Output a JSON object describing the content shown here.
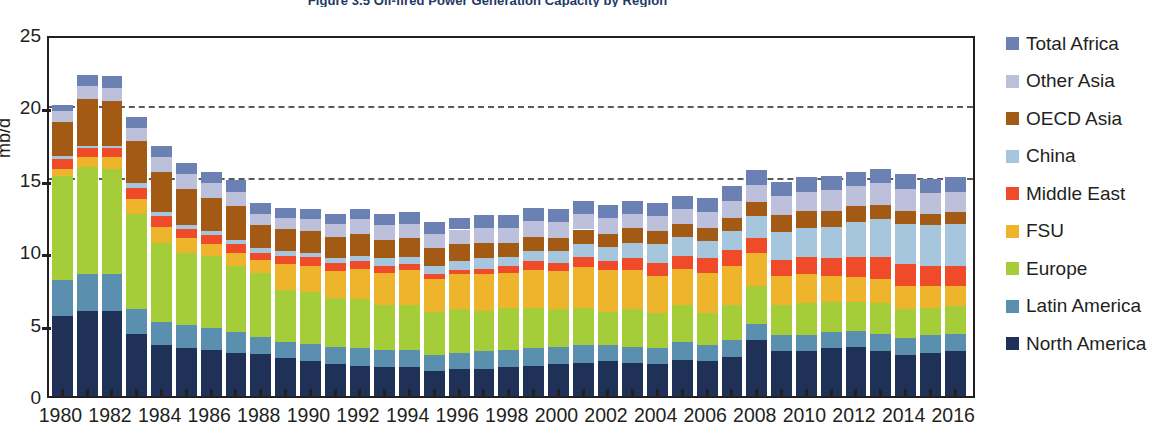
{
  "chart_data": {
    "type": "bar",
    "subtype": "stacked-bar",
    "title": "Figure 3.5  Oil-fired Power Generation Capacity by Region",
    "xlabel": "",
    "ylabel": "mb/d",
    "ylim": [
      0,
      25
    ],
    "yticks": [
      0,
      5,
      10,
      15,
      20,
      25
    ],
    "grid": false,
    "legend_position": "right",
    "reference_lines": [
      20.3,
      15.3
    ],
    "x": [
      1980,
      1981,
      1982,
      1983,
      1984,
      1985,
      1986,
      1987,
      1988,
      1989,
      1990,
      1991,
      1992,
      1993,
      1994,
      1995,
      1996,
      1997,
      1998,
      1999,
      2000,
      2001,
      2002,
      2003,
      2004,
      2005,
      2006,
      2007,
      2008,
      2009,
      2010,
      2011,
      2012,
      2013,
      2014,
      2015,
      2016
    ],
    "xtick_labels": [
      "1980",
      "1982",
      "1984",
      "1986",
      "1988",
      "1990",
      "1992",
      "1994",
      "1996",
      "1998",
      "2000",
      "2002",
      "2004",
      "2006",
      "2008",
      "2010",
      "2012",
      "2014",
      "2016"
    ],
    "colors": {
      "North America": "#1f3157",
      "Latin America": "#5b8fb0",
      "Europe": "#a4cd39",
      "FSU": "#eeb42c",
      "Middle East": "#ef4b2b",
      "China": "#a5c6dd",
      "OECD Asia": "#a35a15",
      "Other Asia": "#bdc0da",
      "Total Africa": "#6b81b4"
    },
    "series": [
      {
        "name": "North America",
        "color": "#1f3157",
        "values": [
          5.5,
          5.9,
          5.9,
          4.3,
          3.5,
          3.3,
          3.2,
          3.0,
          2.9,
          2.6,
          2.4,
          2.2,
          2.1,
          2.0,
          2.0,
          1.7,
          1.9,
          1.9,
          2.0,
          2.1,
          2.2,
          2.3,
          2.4,
          2.3,
          2.2,
          2.5,
          2.4,
          2.7,
          3.9,
          3.1,
          3.1,
          3.3,
          3.4,
          3.1,
          2.8,
          3.0,
          3.1
        ]
      },
      {
        "name": "Latin America",
        "color": "#5b8fb0",
        "values": [
          2.5,
          2.5,
          2.5,
          1.7,
          1.6,
          1.6,
          1.5,
          1.4,
          1.2,
          1.1,
          1.2,
          1.2,
          1.2,
          1.2,
          1.2,
          1.1,
          1.1,
          1.2,
          1.2,
          1.2,
          1.2,
          1.2,
          1.1,
          1.1,
          1.1,
          1.2,
          1.1,
          1.2,
          1.1,
          1.1,
          1.1,
          1.1,
          1.1,
          1.2,
          1.2,
          1.2,
          1.2
        ]
      },
      {
        "name": "Europe",
        "color": "#a4cd39",
        "values": [
          7.2,
          7.4,
          7.3,
          6.6,
          5.5,
          5.0,
          5.0,
          4.6,
          4.4,
          3.6,
          3.6,
          3.4,
          3.4,
          3.1,
          3.1,
          3.0,
          3.0,
          2.8,
          2.9,
          2.8,
          2.6,
          2.6,
          2.3,
          2.6,
          2.4,
          2.6,
          2.2,
          2.4,
          2.6,
          2.1,
          2.2,
          2.1,
          2.0,
          2.1,
          2.0,
          1.9,
          1.9
        ]
      },
      {
        "name": "FSU",
        "color": "#eeb42c",
        "values": [
          0.5,
          0.7,
          0.8,
          1.0,
          1.1,
          1.0,
          0.8,
          0.9,
          0.9,
          1.8,
          1.8,
          1.8,
          2.1,
          2.2,
          2.4,
          2.3,
          2.4,
          2.5,
          2.4,
          2.6,
          2.6,
          2.8,
          2.9,
          2.7,
          2.6,
          2.5,
          2.8,
          2.7,
          2.3,
          2.0,
          2.0,
          1.8,
          1.7,
          1.7,
          1.6,
          1.5,
          1.4
        ]
      },
      {
        "name": "Middle East",
        "color": "#ef4b2b",
        "values": [
          0.7,
          0.6,
          0.6,
          0.8,
          0.7,
          0.6,
          0.6,
          0.6,
          0.5,
          0.6,
          0.6,
          0.6,
          0.5,
          0.5,
          0.4,
          0.3,
          0.3,
          0.4,
          0.5,
          0.6,
          0.6,
          0.7,
          0.6,
          0.8,
          0.9,
          0.9,
          1.0,
          1.1,
          1.0,
          1.1,
          1.2,
          1.2,
          1.4,
          1.5,
          1.5,
          1.4,
          1.4
        ]
      },
      {
        "name": "China",
        "color": "#a5c6dd",
        "values": [
          0.2,
          0.2,
          0.2,
          0.3,
          0.3,
          0.3,
          0.3,
          0.3,
          0.3,
          0.3,
          0.3,
          0.3,
          0.4,
          0.5,
          0.5,
          0.6,
          0.6,
          0.7,
          0.6,
          0.7,
          0.8,
          0.9,
          1.0,
          1.1,
          1.3,
          1.3,
          1.2,
          1.3,
          1.5,
          1.9,
          2.0,
          2.2,
          2.4,
          2.6,
          2.8,
          2.8,
          2.9
        ]
      },
      {
        "name": "OECD Asia",
        "color": "#a35a15",
        "values": [
          2.3,
          3.2,
          3.1,
          2.9,
          2.8,
          2.5,
          2.3,
          2.3,
          1.6,
          1.5,
          1.5,
          1.5,
          1.5,
          1.3,
          1.3,
          1.2,
          1.2,
          1.1,
          1.0,
          1.0,
          0.9,
          1.0,
          0.9,
          1.0,
          0.9,
          0.9,
          0.9,
          0.9,
          1.0,
          1.2,
          1.2,
          1.1,
          1.1,
          1.0,
          0.9,
          0.8,
          0.8
        ]
      },
      {
        "name": "Other Asia",
        "color": "#bdc0da",
        "values": [
          0.8,
          0.9,
          0.9,
          0.9,
          1.0,
          1.0,
          1.0,
          1.0,
          0.8,
          0.8,
          0.8,
          0.9,
          1.0,
          1.0,
          1.0,
          1.0,
          1.0,
          1.0,
          1.0,
          1.1,
          1.1,
          1.1,
          1.1,
          1.0,
          1.0,
          1.0,
          1.1,
          1.2,
          1.2,
          1.3,
          1.3,
          1.4,
          1.4,
          1.5,
          1.5,
          1.4,
          1.4
        ]
      },
      {
        "name": "Total Africa",
        "color": "#6b81b4",
        "values": [
          0.4,
          0.8,
          0.8,
          0.8,
          0.8,
          0.8,
          0.8,
          0.8,
          0.7,
          0.7,
          0.7,
          0.7,
          0.7,
          0.8,
          0.8,
          0.8,
          0.8,
          0.9,
          0.9,
          0.9,
          0.9,
          0.9,
          0.9,
          0.9,
          0.9,
          0.9,
          1.0,
          1.0,
          1.0,
          1.0,
          1.0,
          1.0,
          1.0,
          1.0,
          1.0,
          1.0,
          1.0
        ]
      }
    ],
    "totals": [
      20.1,
      22.2,
      22.1,
      19.3,
      17.3,
      16.1,
      15.5,
      14.9,
      13.3,
      13.0,
      12.9,
      12.6,
      12.9,
      12.6,
      12.7,
      12.0,
      12.3,
      12.5,
      12.5,
      13.0,
      12.9,
      13.5,
      13.2,
      13.5,
      13.3,
      13.8,
      13.7,
      14.5,
      15.6,
      14.8,
      15.1,
      15.2,
      15.5,
      15.7,
      15.3,
      15.0,
      15.1
    ]
  },
  "legend": {
    "items": [
      {
        "label": "Total Africa",
        "color": "#6b81b4"
      },
      {
        "label": "Other Asia",
        "color": "#bdc0da"
      },
      {
        "label": "OECD Asia",
        "color": "#a35a15"
      },
      {
        "label": "China",
        "color": "#a5c6dd"
      },
      {
        "label": "Middle East",
        "color": "#ef4b2b"
      },
      {
        "label": "FSU",
        "color": "#eeb42c"
      },
      {
        "label": "Europe",
        "color": "#a4cd39"
      },
      {
        "label": "Latin America",
        "color": "#5b8fb0"
      },
      {
        "label": "North America",
        "color": "#1f3157"
      }
    ]
  }
}
